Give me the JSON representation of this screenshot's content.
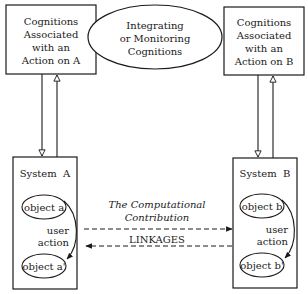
{
  "diagram": {
    "top_left_box": {
      "lines": [
        "Cognitions",
        "Associated",
        "with an",
        "Action on A"
      ]
    },
    "center_ellipse": {
      "lines": [
        "Integrating",
        "or Monitoring",
        "Cognitions"
      ]
    },
    "top_right_box": {
      "lines": [
        "Cognitions",
        "Associated",
        "with an",
        "Action on B"
      ]
    },
    "system_a": {
      "title": "System  A",
      "object_top": "object a",
      "object_bottom": "object a'",
      "action_lines": [
        "user",
        "action"
      ]
    },
    "system_b": {
      "title": "System  B",
      "object_top": "object b",
      "object_bottom": "object b'",
      "action_lines": [
        "user",
        "action"
      ]
    },
    "middle": {
      "contribution_lines": [
        "The Computational",
        "Contribution"
      ],
      "linkages_label": "LINKAGES"
    },
    "colors": {
      "stroke": "#1a1a1a",
      "background": "#ffffff"
    }
  }
}
